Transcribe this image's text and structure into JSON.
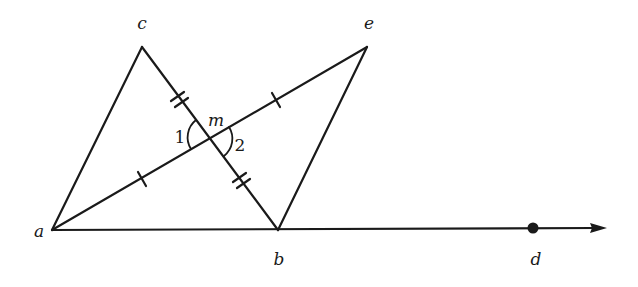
{
  "diagram": {
    "stroke_color": "#1a1a1a",
    "points": {
      "a": {
        "label": "a",
        "x": 52,
        "y": 230
      },
      "b": {
        "label": "b",
        "x": 278,
        "y": 230
      },
      "c": {
        "label": "c",
        "x": 142,
        "y": 47
      },
      "e": {
        "label": "e",
        "x": 367,
        "y": 47
      },
      "m": {
        "label": "m",
        "x": 210,
        "y": 138
      },
      "d": {
        "label": "d",
        "x": 533,
        "y": 228
      }
    },
    "labels": {
      "a": "a",
      "b": "b",
      "c": "c",
      "d": "d",
      "e": "e",
      "m": "m",
      "angle1": "1",
      "angle2": "2"
    },
    "segments": [
      {
        "from": "a",
        "to": "c"
      },
      {
        "from": "c",
        "to": "b"
      },
      {
        "from": "a",
        "to": "e"
      },
      {
        "from": "e",
        "to": "b"
      }
    ],
    "ray": {
      "from": "a",
      "through": "d",
      "arrow_tip": {
        "x": 606,
        "y": 228
      }
    },
    "tick_marks": [
      {
        "segment": "am",
        "count": 1
      },
      {
        "segment": "me",
        "count": 1
      },
      {
        "segment": "cm",
        "count": 2
      },
      {
        "segment": "mb",
        "count": 2
      }
    ],
    "angles": [
      {
        "label": "1",
        "vertex": "m",
        "between": [
          "mc",
          "ma"
        ]
      },
      {
        "label": "2",
        "vertex": "m",
        "between": [
          "me",
          "mb"
        ]
      }
    ]
  }
}
